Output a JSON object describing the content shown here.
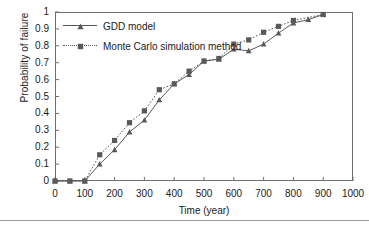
{
  "chart_data": {
    "type": "line",
    "title": "",
    "xlabel": "Time (year)",
    "ylabel": "Probability of failure",
    "xlim": [
      0,
      1000
    ],
    "ylim": [
      0,
      1
    ],
    "xticks": [
      0,
      100,
      200,
      300,
      400,
      500,
      600,
      700,
      800,
      900,
      1000
    ],
    "xtick_labels": [
      "0",
      "100",
      "200",
      "300",
      "400",
      "500",
      "600",
      "700",
      "800",
      "900",
      "1000"
    ],
    "yticks": [
      0,
      0.1,
      0.2,
      0.3,
      0.4,
      0.5,
      0.6,
      0.7,
      0.8,
      0.9,
      1
    ],
    "ytick_labels": [
      "0",
      "0.1",
      "0.2",
      "0.3",
      "0.4",
      "0.5",
      "0.6",
      "0.7",
      "0.8",
      "0.9",
      "1"
    ],
    "grid": false,
    "legend_position": "upper left",
    "series": [
      {
        "name": "GDD model",
        "marker": "triangle",
        "linestyle": "solid",
        "color": "#595959",
        "x": [
          0,
          50,
          100,
          150,
          200,
          250,
          300,
          350,
          400,
          450,
          500,
          550,
          600,
          650,
          700,
          750,
          800,
          850,
          900
        ],
        "y": [
          0,
          0,
          0,
          0.1,
          0.185,
          0.29,
          0.36,
          0.48,
          0.575,
          0.63,
          0.71,
          0.72,
          0.78,
          0.77,
          0.81,
          0.875,
          0.935,
          0.955,
          0.985
        ]
      },
      {
        "name": "Monte Carlo simulation method",
        "marker": "square",
        "linestyle": "dotted",
        "color": "#595959",
        "x": [
          0,
          50,
          100,
          150,
          200,
          250,
          300,
          350,
          400,
          450,
          500,
          550,
          600,
          650,
          700,
          750,
          800,
          900
        ],
        "y": [
          0,
          0,
          0,
          0.155,
          0.24,
          0.345,
          0.415,
          0.54,
          0.575,
          0.65,
          0.71,
          0.725,
          0.81,
          0.835,
          0.88,
          0.915,
          0.95,
          0.985
        ]
      }
    ]
  },
  "axes": {
    "xlabel": "Time (year)",
    "ylabel": "Probability of failure"
  },
  "legend": {
    "entries": [
      {
        "label": "GDD model"
      },
      {
        "label": "Monte Carlo simulation method"
      }
    ]
  },
  "style": {
    "frame_color": "#6f6f6f",
    "ink_color": "#1a1a1a",
    "series_color": "#595959",
    "rule_color": "#9a9a9a"
  }
}
